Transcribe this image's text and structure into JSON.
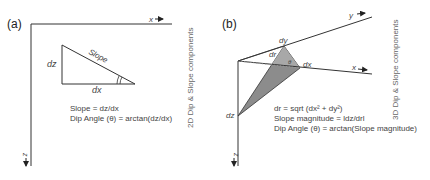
{
  "panel_a": {
    "label": "(a)",
    "x_axis": "x",
    "z_axis": "z",
    "dz": "dz",
    "dx": "dx",
    "slope": "Slope",
    "eq1": "Slope = dz/dx",
    "eq2": "Dip Angle (θ) = arctan(dz/dx)",
    "side_title": "2D Dip & Slope components"
  },
  "panel_b": {
    "label": "(b)",
    "x_axis": "x",
    "y_axis": "y",
    "z_axis": "z",
    "dz": "dz",
    "dx": "dx",
    "dy": "dy",
    "dr": "dr",
    "theta": "θ",
    "eq1": "dr = sqrt (dx² + dy²)",
    "eq2": "Slope magnitude = ldz/drl",
    "eq3": "Dip Angle (θ) = arctan(Slope magnitude)",
    "side_title": "3D Dip & Slope components"
  },
  "colors": {
    "line": "#333333",
    "fill": "#8c8c8c",
    "text": "#444444"
  }
}
